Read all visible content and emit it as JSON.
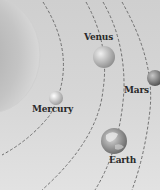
{
  "diagram": {
    "sun": {
      "name": "Sun",
      "color": "#bdbdbd"
    },
    "orbit_color": "#777777",
    "planets": [
      {
        "name": "Mercury",
        "label": "Mercury",
        "color": "#e8e8e8"
      },
      {
        "name": "Venus",
        "label": "Venus",
        "color": "#c6c6c6"
      },
      {
        "name": "Earth",
        "label": "Earth",
        "color": "#9a9a9a"
      },
      {
        "name": "Mars",
        "label": "Mars",
        "color": "#8c8c8c"
      }
    ]
  }
}
